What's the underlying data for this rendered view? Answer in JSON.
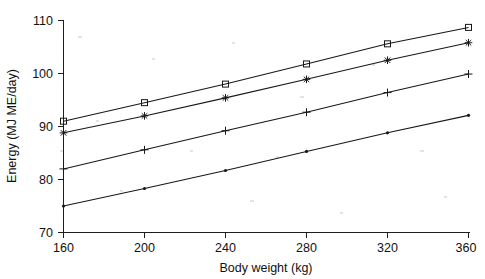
{
  "chart_data": {
    "type": "line",
    "title": "",
    "subtitle": "",
    "xlabel": "Body weight (kg)",
    "ylabel": "Energy (MJ ME/day)",
    "xlim": [
      160,
      360
    ],
    "ylim": [
      70,
      110
    ],
    "xticks": [
      160,
      200,
      240,
      280,
      320,
      360
    ],
    "yticks": [
      70,
      80,
      90,
      100,
      110
    ],
    "xtick_labels": [
      "160",
      "200",
      "240",
      "280",
      "320",
      "360"
    ],
    "ytick_labels": [
      "70",
      "80",
      "90",
      "100",
      "110"
    ],
    "grid": false,
    "legend": "none",
    "x": [
      160,
      200,
      240,
      280,
      320,
      360
    ],
    "series": [
      {
        "name": "series-square",
        "marker": "square",
        "values": [
          91.0,
          94.5,
          98.0,
          101.8,
          105.6,
          108.7
        ]
      },
      {
        "name": "series-asterisk",
        "marker": "asterisk",
        "values": [
          88.8,
          92.0,
          95.4,
          98.9,
          102.5,
          105.8
        ]
      },
      {
        "name": "series-plus",
        "marker": "plus",
        "values": [
          82.0,
          85.6,
          89.2,
          92.7,
          96.4,
          99.9
        ]
      },
      {
        "name": "series-dot",
        "marker": "dot",
        "values": [
          75.0,
          78.3,
          81.7,
          85.3,
          88.8,
          92.1
        ]
      }
    ]
  },
  "axes": {
    "x_title": "Body weight (kg)",
    "y_title": "Energy (MJ ME/day)"
  },
  "style": {
    "line_color": "#171717",
    "axis_color": "#1d1d1d",
    "background": "#ffffff"
  }
}
